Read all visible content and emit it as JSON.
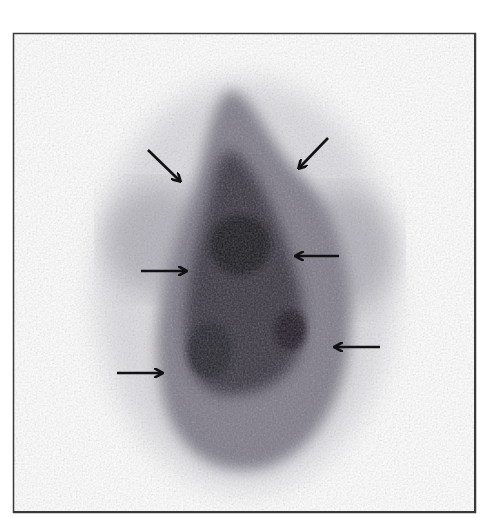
{
  "figure": {
    "colors": {
      "background": "#ffffff",
      "frame_border": "#3a3a3a",
      "uptake_dark": "#1e1a24",
      "uptake_mid": "#6e6a78",
      "uptake_light": "#c8c6cc",
      "arrow": "#111111"
    },
    "arrows": [
      {
        "name": "arrow-upper-left",
        "x1": 148,
        "y1": 150,
        "x2": 180,
        "y2": 181,
        "direction": "down-right"
      },
      {
        "name": "arrow-upper-right",
        "x1": 328,
        "y1": 138,
        "x2": 299,
        "y2": 168,
        "direction": "down-left"
      },
      {
        "name": "arrow-middle-left",
        "x1": 141,
        "y1": 271,
        "x2": 186,
        "y2": 271,
        "direction": "right"
      },
      {
        "name": "arrow-middle-right",
        "x1": 339,
        "y1": 256,
        "x2": 296,
        "y2": 256,
        "direction": "left"
      },
      {
        "name": "arrow-lower-right",
        "x1": 380,
        "y1": 347,
        "x2": 335,
        "y2": 347,
        "direction": "left"
      },
      {
        "name": "arrow-lower-left",
        "x1": 117,
        "y1": 373,
        "x2": 162,
        "y2": 373,
        "direction": "right"
      }
    ]
  }
}
